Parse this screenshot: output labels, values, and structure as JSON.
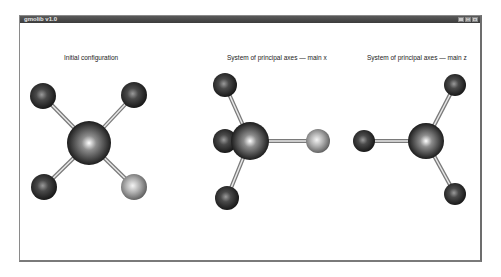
{
  "window": {
    "title": "gmolib v1.0",
    "controls": {
      "minimize": "_",
      "maximize": "□",
      "close": "×"
    }
  },
  "panels": [
    {
      "title": "Initial configuration",
      "center": {
        "x": 89,
        "y": 143,
        "r": 22,
        "color": "#2a2a2a"
      },
      "atoms": [
        {
          "x": 43,
          "y": 96,
          "r": 13,
          "color": "#3a3a3a"
        },
        {
          "x": 134,
          "y": 95,
          "r": 13,
          "color": "#3a3a3a"
        },
        {
          "x": 44,
          "y": 187,
          "r": 13,
          "color": "#3a3a3a"
        },
        {
          "x": 134,
          "y": 187,
          "r": 13,
          "color": "#a8a8a8"
        }
      ]
    },
    {
      "title": "System of principal axes — main x",
      "center": {
        "x": 250,
        "y": 141,
        "r": 19,
        "color": "#2a2a2a"
      },
      "atoms": [
        {
          "x": 225,
          "y": 85,
          "r": 12,
          "color": "#3a3a3a"
        },
        {
          "x": 225,
          "y": 141,
          "r": 12,
          "color": "#3a3a3a"
        },
        {
          "x": 227,
          "y": 198,
          "r": 12,
          "color": "#3a3a3a"
        },
        {
          "x": 318,
          "y": 141,
          "r": 12,
          "color": "#a8a8a8"
        }
      ]
    },
    {
      "title": "System of principal axes — main z",
      "center": {
        "x": 426,
        "y": 141,
        "r": 18,
        "color": "#2a2a2a"
      },
      "atoms": [
        {
          "x": 455,
          "y": 85,
          "r": 11,
          "color": "#3a3a3a"
        },
        {
          "x": 364,
          "y": 141,
          "r": 11,
          "color": "#3a3a3a"
        },
        {
          "x": 455,
          "y": 194,
          "r": 11,
          "color": "#3a3a3a"
        }
      ]
    }
  ],
  "panel_title_positions": [
    {
      "left": 64,
      "top": 54
    },
    {
      "left": 227,
      "top": 54
    },
    {
      "left": 367,
      "top": 54
    }
  ]
}
